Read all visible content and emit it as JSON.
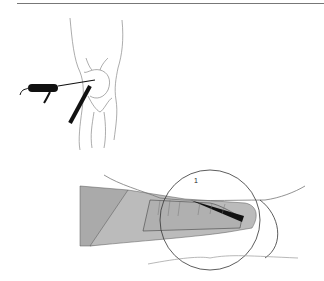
{
  "figure": {
    "top_panel": {
      "description": "Knee joint line drawing with inserted probe and needle"
    },
    "bottom_panel": {
      "description": "Cross-section of probe tip with magnified circle",
      "label": "1"
    }
  }
}
